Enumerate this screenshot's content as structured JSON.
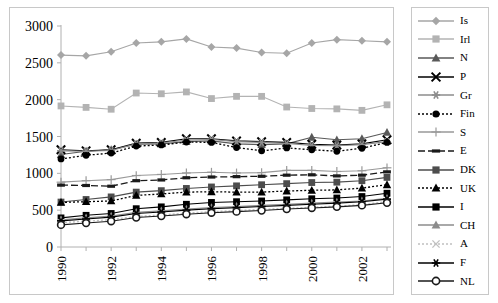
{
  "chart_data": {
    "type": "line",
    "title": "",
    "xlabel": "",
    "ylabel": "",
    "x": [
      1990,
      1991,
      1992,
      1993,
      1994,
      1995,
      1996,
      1997,
      1998,
      1999,
      2000,
      2001,
      2002,
      2003
    ],
    "xtick_labels": [
      "1990",
      "1992",
      "1994",
      "1996",
      "1998",
      "2000",
      "2002"
    ],
    "xtick_values": [
      1990,
      1992,
      1994,
      1996,
      1998,
      2000,
      2002
    ],
    "ytick_labels": [
      "0",
      "500",
      "1000",
      "1500",
      "2000",
      "2500",
      "3000"
    ],
    "ytick_values": [
      0,
      500,
      1000,
      1500,
      2000,
      2500,
      3000
    ],
    "ylim": [
      0,
      3000
    ],
    "grid": false,
    "legend_position": "right",
    "series": [
      {
        "name": "Is",
        "marker": "diamond",
        "dash": "solid",
        "color": "#a6a6a6",
        "values": [
          2605,
          2595,
          2650,
          2770,
          2785,
          2825,
          2715,
          2700,
          2640,
          2630,
          2770,
          2815,
          2800,
          2785
        ]
      },
      {
        "name": "Irl",
        "marker": "square",
        "dash": "solid",
        "color": "#b3b3b3",
        "values": [
          1915,
          1895,
          1870,
          2090,
          2080,
          2105,
          2015,
          2045,
          2045,
          1900,
          1880,
          1875,
          1855,
          1930
        ]
      },
      {
        "name": "N",
        "marker": "triangle",
        "dash": "solid",
        "color": "#595959",
        "values": [
          1255,
          1300,
          1320,
          1395,
          1400,
          1430,
          1440,
          1400,
          1390,
          1400,
          1490,
          1455,
          1470,
          1555
        ]
      },
      {
        "name": "P",
        "marker": "cross",
        "dash": "solid",
        "color": "#000000",
        "values": [
          1320,
          1305,
          1320,
          1410,
          1420,
          1470,
          1470,
          1440,
          1430,
          1420,
          1395,
          1385,
          1400,
          1455
        ]
      },
      {
        "name": "Gr",
        "marker": "star",
        "dash": "solid",
        "color": "#8c8c8c",
        "values": [
          1305,
          1300,
          1310,
          1400,
          1415,
          1450,
          1460,
          1430,
          1420,
          1405,
          1380,
          1375,
          1390,
          1430
        ]
      },
      {
        "name": "Fin",
        "marker": "circle",
        "dash": "dotted",
        "color": "#000000",
        "values": [
          1195,
          1245,
          1275,
          1370,
          1385,
          1425,
          1420,
          1350,
          1305,
          1345,
          1320,
          1300,
          1340,
          1420
        ]
      },
      {
        "name": "S",
        "marker": "plus",
        "dash": "solid",
        "color": "#999999",
        "values": [
          880,
          900,
          915,
          970,
          985,
          1005,
          1015,
          1005,
          1010,
          1040,
          1040,
          1025,
          1035,
          1075
        ]
      },
      {
        "name": "E",
        "marker": "dash-marker",
        "dash": "dashed",
        "color": "#1a1a1a",
        "values": [
          840,
          835,
          825,
          900,
          910,
          940,
          950,
          955,
          960,
          975,
          980,
          965,
          975,
          1020
        ]
      },
      {
        "name": "DK",
        "marker": "square",
        "dash": "solid",
        "color": "#4d4d4d",
        "values": [
          610,
          645,
          680,
          745,
          765,
          795,
          815,
          830,
          845,
          860,
          875,
          880,
          900,
          945
        ]
      },
      {
        "name": "UK",
        "marker": "triangle",
        "dash": "dotted",
        "color": "#000000",
        "values": [
          605,
          615,
          625,
          700,
          720,
          745,
          750,
          745,
          745,
          760,
          770,
          775,
          800,
          845
        ]
      },
      {
        "name": "I",
        "marker": "square",
        "dash": "solid",
        "color": "#000000",
        "values": [
          395,
          430,
          455,
          520,
          545,
          580,
          605,
          615,
          625,
          640,
          655,
          665,
          685,
          730
        ]
      },
      {
        "name": "CH",
        "marker": "triangle",
        "dash": "solid",
        "color": "#8c8c8c",
        "values": [
          370,
          395,
          420,
          470,
          490,
          515,
          535,
          550,
          565,
          580,
          595,
          610,
          625,
          660
        ]
      },
      {
        "name": "A",
        "marker": "x",
        "dash": "dotted",
        "color": "#c0c0c0",
        "values": [
          330,
          350,
          370,
          415,
          435,
          460,
          480,
          495,
          510,
          525,
          540,
          555,
          575,
          615
        ]
      },
      {
        "name": "F",
        "marker": "star",
        "dash": "solid",
        "color": "#000000",
        "values": [
          355,
          380,
          405,
          455,
          475,
          500,
          520,
          535,
          550,
          565,
          580,
          595,
          615,
          650
        ]
      },
      {
        "name": "NL",
        "marker": "open-circle",
        "dash": "solid",
        "color": "#1a1a1a",
        "values": [
          300,
          325,
          350,
          400,
          420,
          445,
          465,
          480,
          495,
          515,
          530,
          545,
          565,
          600
        ]
      }
    ]
  },
  "legend": {
    "items": [
      {
        "label": "Is"
      },
      {
        "label": "Irl"
      },
      {
        "label": "N"
      },
      {
        "label": "P"
      },
      {
        "label": "Gr"
      },
      {
        "label": "Fin"
      },
      {
        "label": "S"
      },
      {
        "label": "E"
      },
      {
        "label": "DK"
      },
      {
        "label": "UK"
      },
      {
        "label": "I"
      },
      {
        "label": "CH"
      },
      {
        "label": "A"
      },
      {
        "label": "F"
      },
      {
        "label": "NL"
      }
    ]
  }
}
